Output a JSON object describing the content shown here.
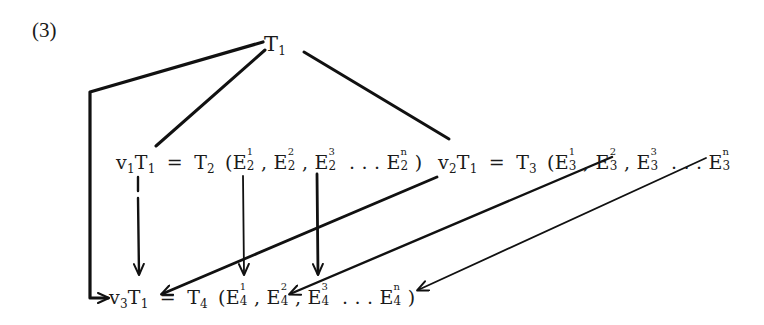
{
  "figure": {
    "number_label": "(3)",
    "nodes": {
      "root": {
        "base": "T",
        "sub": "1"
      },
      "row2_left": {
        "prefix_base": "v",
        "prefix_sub": "1",
        "op_base": "T",
        "op_sub": "1",
        "equals": "=",
        "result_base": "T",
        "result_sub": "2",
        "open": "(",
        "elements": [
          {
            "base": "E",
            "sup": "1",
            "sub": "2",
            "sep": ","
          },
          {
            "base": "E",
            "sup": "2",
            "sub": "2",
            "sep": ","
          },
          {
            "base": "E",
            "sup": "3",
            "sub": "2",
            "sep": ""
          },
          {
            "ellipsis": ". . ."
          },
          {
            "base": "E",
            "sup": "n",
            "sub": "2",
            "sep": ""
          }
        ],
        "close": ")"
      },
      "row2_right": {
        "prefix_base": "v",
        "prefix_sub": "2",
        "op_base": "T",
        "op_sub": "1",
        "equals": "=",
        "result_base": "T",
        "result_sub": "3",
        "open": "(",
        "elements": [
          {
            "base": "E",
            "sup": "1",
            "sub": "3",
            "sep": ","
          },
          {
            "base": "E",
            "sup": "2",
            "sub": "3",
            "sep": ","
          },
          {
            "base": "E",
            "sup": "3",
            "sub": "3",
            "sep": ""
          },
          {
            "ellipsis": ". . ."
          },
          {
            "base": "E",
            "sup": "n",
            "sub": "3",
            "sep": ""
          }
        ],
        "close": ""
      },
      "row3": {
        "prefix_base": "v",
        "prefix_sub": "3",
        "op_base": "T",
        "op_sub": "1",
        "equals": "=",
        "result_base": "T",
        "result_sub": "4",
        "open": "(",
        "elements": [
          {
            "base": "E",
            "sup": "1",
            "sub": "4",
            "sep": ","
          },
          {
            "base": "E",
            "sup": "2",
            "sub": "4",
            "sep": ","
          },
          {
            "base": "E",
            "sup": "3",
            "sub": "4",
            "sep": ""
          },
          {
            "ellipsis": ". . ."
          },
          {
            "base": "E",
            "sup": "n",
            "sub": "4",
            "sep": ""
          }
        ],
        "close": ")"
      }
    },
    "edges": [
      {
        "from": "T1",
        "to": "v1T1",
        "type": "line"
      },
      {
        "from": "T1",
        "to": "v2T1",
        "type": "line"
      },
      {
        "from": "T1",
        "to": "v3T1",
        "type": "elbow-arrow"
      },
      {
        "from": "v1T1",
        "to": "v3T1",
        "type": "arrow"
      },
      {
        "from": "E2^1",
        "to": "E4^1",
        "type": "arrow"
      },
      {
        "from": "E2^3",
        "to": "E4^2",
        "type": "arrow"
      },
      {
        "from": "v2T1",
        "to": "v3T1",
        "type": "arrow"
      },
      {
        "from": "E3^2",
        "to": "E4^2",
        "type": "arrow"
      },
      {
        "from": "E3^n",
        "to": "E4^n",
        "type": "arrow"
      }
    ]
  }
}
